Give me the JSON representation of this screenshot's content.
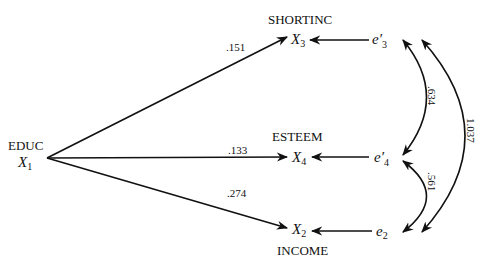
{
  "diagram": {
    "type": "path-diagram",
    "nodes": {
      "educ": {
        "caption": "EDUC",
        "symbol": "X",
        "subscript": "1"
      },
      "x3": {
        "caption": "SHORTINC",
        "symbol": "X",
        "subscript": "3"
      },
      "x4": {
        "caption": "ESTEEM",
        "symbol": "X",
        "subscript": "4"
      },
      "x2": {
        "caption": "INCOME",
        "symbol": "X",
        "subscript": "2"
      },
      "e3": {
        "symbol": "e′",
        "subscript": "3"
      },
      "e4": {
        "symbol": "e′",
        "subscript": "4"
      },
      "e2": {
        "symbol": "e",
        "subscript": "2"
      }
    },
    "paths": [
      {
        "from": "X1",
        "to": "X3",
        "coefficient": ".151"
      },
      {
        "from": "X1",
        "to": "X4",
        "coefficient": ".133"
      },
      {
        "from": "X1",
        "to": "X2",
        "coefficient": ".274"
      },
      {
        "from": "e'3",
        "to": "X3",
        "coefficient": ""
      },
      {
        "from": "e'4",
        "to": "X4",
        "coefficient": ""
      },
      {
        "from": "e2",
        "to": "X2",
        "coefficient": ""
      }
    ],
    "covariances": [
      {
        "between": [
          "e'3",
          "e'4"
        ],
        "value": ".634"
      },
      {
        "between": [
          "e'4",
          "e2"
        ],
        "value": ".561"
      },
      {
        "between": [
          "e'3",
          "e2"
        ],
        "value": "1.037"
      }
    ]
  }
}
